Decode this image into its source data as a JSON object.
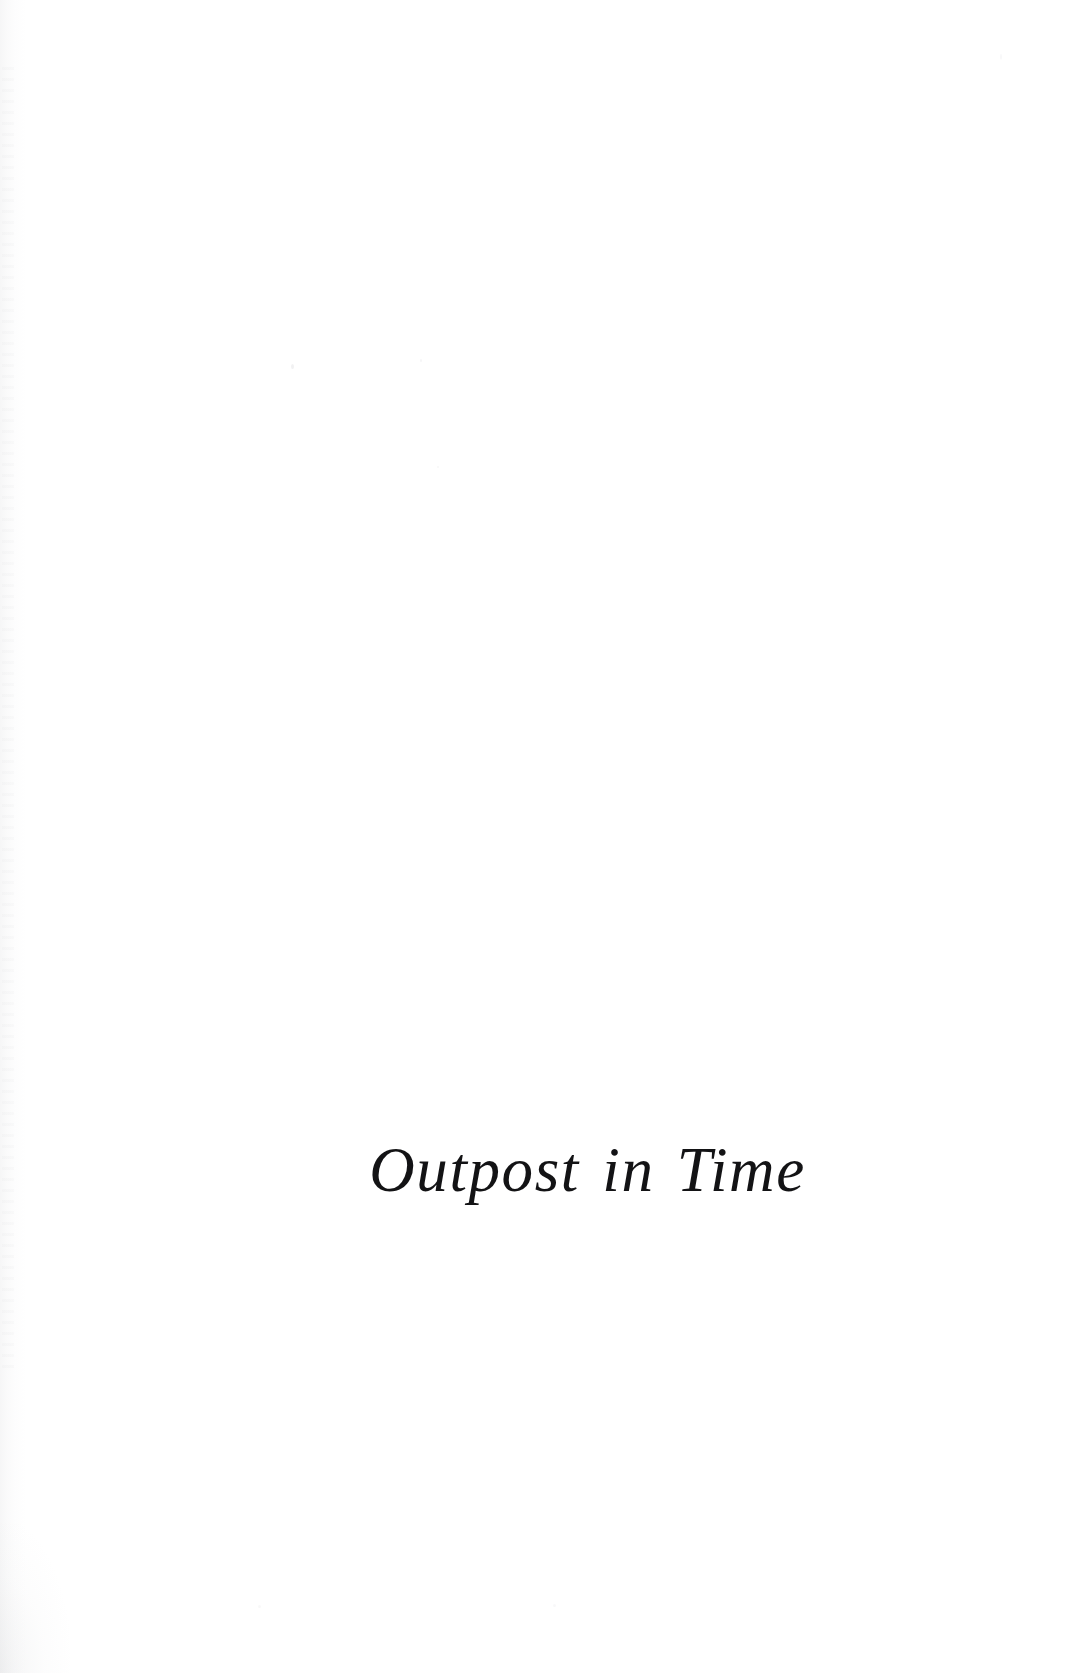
{
  "document": {
    "type": "book-half-title-page",
    "page_background_color": "#ffffff",
    "ink_color": "#131315",
    "title": "Outpost in Time",
    "title_style": "italic-serif",
    "title_alignment": "right-of-center",
    "body_text": "",
    "header": "",
    "footer": "",
    "page_number": "",
    "artifacts": {
      "left_edge_shading_label": "scanner-edge-shading",
      "speckles_label": "scan-speckles"
    }
  }
}
